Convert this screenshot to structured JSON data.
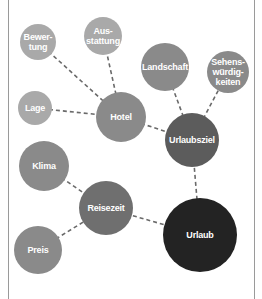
{
  "diagram": {
    "type": "mind-map",
    "colors": {
      "light": "#a9a9a9",
      "medium": "#8a8a8a",
      "mediumdark": "#6f6f6f",
      "dark": "#5c5c5c",
      "darkest": "#232323",
      "edge": "#6a6a6a"
    },
    "nodes": [
      {
        "id": "bewertung",
        "label": "Bewer-\ntung",
        "cx": 38,
        "cy": 42,
        "r": 18,
        "shade": "light"
      },
      {
        "id": "ausstattung",
        "label": "Aus-\nstattung",
        "cx": 103,
        "cy": 36,
        "r": 19,
        "shade": "light"
      },
      {
        "id": "lage",
        "label": "Lage",
        "cx": 35,
        "cy": 108,
        "r": 17,
        "shade": "light"
      },
      {
        "id": "hotel",
        "label": "Hotel",
        "cx": 121,
        "cy": 117,
        "r": 25,
        "shade": "medium"
      },
      {
        "id": "landschaft",
        "label": "Landschaft",
        "cx": 165,
        "cy": 67,
        "r": 24,
        "shade": "medium"
      },
      {
        "id": "sehenswuerdigkeiten",
        "label": "Sehens-\nwürdig-\nkeiten",
        "cx": 228,
        "cy": 72,
        "r": 21,
        "shade": "medium"
      },
      {
        "id": "urlaubsziel",
        "label": "Urlaubsziel",
        "cx": 192,
        "cy": 140,
        "r": 27,
        "shade": "dark"
      },
      {
        "id": "klima",
        "label": "Klima",
        "cx": 44,
        "cy": 166,
        "r": 25,
        "shade": "medium"
      },
      {
        "id": "reisezeit",
        "label": "Reisezeit",
        "cx": 106,
        "cy": 208,
        "r": 27,
        "shade": "mediumdark"
      },
      {
        "id": "preis",
        "label": "Preis",
        "cx": 38,
        "cy": 250,
        "r": 24,
        "shade": "medium"
      },
      {
        "id": "urlaub",
        "label": "Urlaub",
        "cx": 200,
        "cy": 235,
        "r": 37,
        "shade": "darkest"
      }
    ],
    "edges": [
      {
        "from": "bewertung",
        "to": "hotel"
      },
      {
        "from": "ausstattung",
        "to": "hotel"
      },
      {
        "from": "lage",
        "to": "hotel"
      },
      {
        "from": "hotel",
        "to": "urlaubsziel"
      },
      {
        "from": "landschaft",
        "to": "urlaubsziel"
      },
      {
        "from": "sehenswuerdigkeiten",
        "to": "urlaubsziel"
      },
      {
        "from": "urlaubsziel",
        "to": "urlaub"
      },
      {
        "from": "klima",
        "to": "reisezeit"
      },
      {
        "from": "preis",
        "to": "reisezeit"
      },
      {
        "from": "reisezeit",
        "to": "urlaub"
      }
    ]
  }
}
